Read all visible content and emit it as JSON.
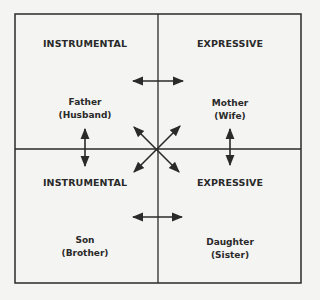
{
  "diagram": {
    "type": "quadrant",
    "quadrants": [
      {
        "position": "top-left",
        "header": "INSTRUMENTAL",
        "role": "Father",
        "alt_role": "(Husband)"
      },
      {
        "position": "top-right",
        "header": "EXPRESSIVE",
        "role": "Mother",
        "alt_role": "(Wife)"
      },
      {
        "position": "bottom-left",
        "header": "INSTRUMENTAL",
        "role": "Son",
        "alt_role": "(Brother)"
      },
      {
        "position": "bottom-right",
        "header": "EXPRESSIVE",
        "role": "Daughter",
        "alt_role": "(Sister)"
      }
    ],
    "arrows": [
      {
        "from": "Father",
        "to": "Mother",
        "type": "bidirectional"
      },
      {
        "from": "Son",
        "to": "Daughter",
        "type": "bidirectional"
      },
      {
        "from": "Father",
        "to": "Son",
        "type": "bidirectional"
      },
      {
        "from": "Mother",
        "to": "Daughter",
        "type": "bidirectional"
      },
      {
        "from": "Father",
        "to": "Daughter",
        "type": "bidirectional"
      },
      {
        "from": "Mother",
        "to": "Son",
        "type": "bidirectional"
      }
    ],
    "colors": {
      "background": "#f4f4f2",
      "ink": "#2a2a2a"
    }
  }
}
